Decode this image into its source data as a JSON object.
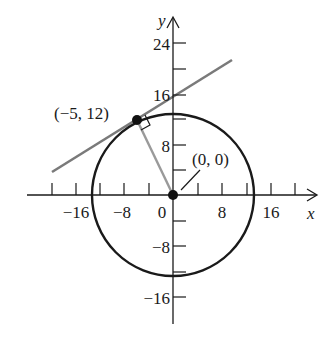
{
  "diagram": {
    "type": "circle-tangent-line",
    "axes": {
      "x_label": "x",
      "y_label": "y",
      "x_tick_labels": [
        {
          "value": -16,
          "text": "−16"
        },
        {
          "value": -8,
          "text": "−8"
        },
        {
          "value": 0,
          "text": "0"
        },
        {
          "value": 8,
          "text": "8"
        },
        {
          "value": 16,
          "text": "16"
        }
      ],
      "y_tick_labels": [
        {
          "value": 24,
          "text": "24"
        },
        {
          "value": 16,
          "text": "16"
        },
        {
          "value": 8,
          "text": "8"
        },
        {
          "value": -8,
          "text": "−8"
        },
        {
          "value": -16,
          "text": "−16"
        }
      ],
      "tick_step": 4
    },
    "circle": {
      "center": [
        0,
        0
      ],
      "radius": 13
    },
    "points": [
      {
        "label": "(−5, 12)",
        "coords": [
          -5,
          12
        ]
      },
      {
        "label": "(0, 0)",
        "coords": [
          0,
          0
        ]
      }
    ],
    "tangent_line": {
      "through": [
        -5,
        12
      ],
      "perpendicular_to_radius": true
    },
    "colors": {
      "axes": "#1a1a1a",
      "circle": "#1a1a1a",
      "tangent": "#7a7a7a",
      "radius": "#9a9a9a"
    }
  }
}
